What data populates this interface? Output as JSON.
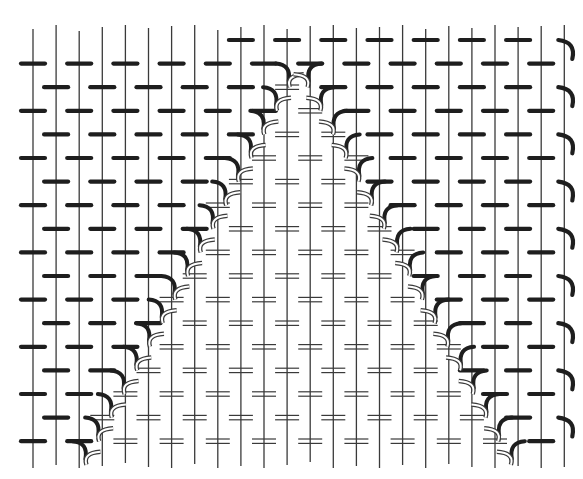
{
  "diagram": {
    "type": "weaving-draft",
    "colors": {
      "background": "#ffffff",
      "warp": "#3a3a3a",
      "weft_solid": "#1e1e1e",
      "weft_double": "#3a3a3a"
    },
    "warp_count": 24,
    "row_count": 18,
    "regions": [
      {
        "name": "background-field",
        "weft_style": "solid-dash"
      },
      {
        "name": "triangle-inlay",
        "weft_style": "double-line",
        "apex_column": 12,
        "base_columns": [
          4,
          20
        ]
      }
    ],
    "edge_turns": {
      "left": "hook",
      "right": "hook",
      "boundary": "paired-hooks"
    }
  }
}
